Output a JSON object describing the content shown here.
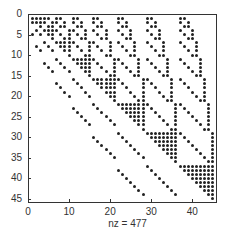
{
  "chart_data": {
    "type": "scatter",
    "subtype": "sparsity-pattern (spy plot)",
    "title": "",
    "xlabel": "nz = 477",
    "ylabel": "",
    "nz": 477,
    "matrix_size": 45,
    "xlim": [
      0,
      46
    ],
    "ylim": [
      46,
      0
    ],
    "x_ticks": [
      0,
      10,
      20,
      30,
      40
    ],
    "y_ticks": [
      0,
      5,
      10,
      15,
      20,
      25,
      30,
      35,
      40,
      45
    ],
    "grid": false,
    "legend": null,
    "block_sizes": [
      1,
      2,
      3,
      4,
      5,
      6,
      7,
      8,
      9
    ],
    "pattern": {
      "diagonal_blocks": "dense upper-triangular",
      "upper_offdiagonal_blocks": "N-shape: diagonal (row r -> col r) plus vertical at col offset = block-row size",
      "lower_offdiagonal": "two sparse parallel diagonal lines below the main diagonal"
    },
    "marker_color": "#222222"
  },
  "labels": {
    "xlabel_text": "nz = 477"
  }
}
